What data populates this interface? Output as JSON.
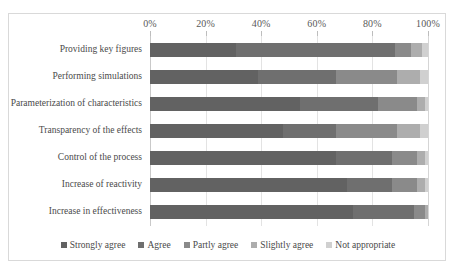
{
  "chart_data": {
    "type": "bar",
    "orientation": "horizontal",
    "stacked": true,
    "normalized_percent": true,
    "title": "",
    "xlabel": "",
    "ylabel": "",
    "xlim": [
      0,
      100
    ],
    "xticks": [
      "0%",
      "20%",
      "40%",
      "60%",
      "80%",
      "100%"
    ],
    "xtick_values": [
      0,
      20,
      40,
      60,
      80,
      100
    ],
    "grid": true,
    "legend_position": "bottom",
    "categories": [
      "Providing key figures",
      "Performing simulations",
      "Parameterization of characteristics",
      "Transparency of the effects",
      "Control of the process",
      "Increase of reactivity",
      "Increase in effectiveness"
    ],
    "series": [
      {
        "name": "Strongly agree",
        "color": "#626262",
        "values": [
          31,
          39,
          54,
          48,
          67,
          71,
          73
        ]
      },
      {
        "name": "Agree",
        "color": "#6f6f6f",
        "values": [
          57,
          28,
          28,
          19,
          20,
          16,
          22
        ]
      },
      {
        "name": "Partly agree",
        "color": "#8a8a8a",
        "values": [
          6,
          22,
          14,
          22,
          9,
          9,
          4
        ]
      },
      {
        "name": "Slightly agree",
        "color": "#adadad",
        "values": [
          4,
          8,
          3,
          8,
          3,
          3,
          1
        ]
      },
      {
        "name": "Not appropriate",
        "color": "#d0d0d0",
        "values": [
          2,
          3,
          1,
          3,
          1,
          1,
          0
        ]
      }
    ]
  }
}
